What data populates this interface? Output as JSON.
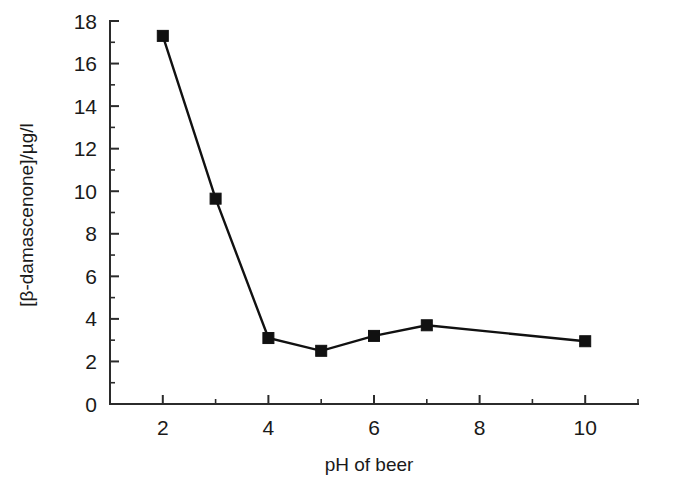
{
  "chart_data": {
    "type": "line",
    "title": "",
    "subtitle": "",
    "xlabel": "pH of beer",
    "ylabel": "[β-damascenone]/µg/l",
    "x": [
      2,
      3,
      4,
      5,
      6,
      7,
      10
    ],
    "values": [
      17.3,
      9.65,
      3.1,
      2.5,
      3.2,
      3.7,
      2.95
    ],
    "series": [
      {
        "name": "[β-damascenone]",
        "x": [
          2,
          3,
          4,
          5,
          6,
          7,
          10
        ],
        "values": [
          17.3,
          9.65,
          3.1,
          2.5,
          3.2,
          3.7,
          2.95
        ]
      }
    ],
    "xlim": [
      1,
      11
    ],
    "ylim": [
      0,
      18
    ],
    "xticks": [
      2,
      4,
      6,
      8,
      10
    ],
    "xtick_labels": [
      "2",
      "4",
      "6",
      "8",
      "10"
    ],
    "x_minor_ticks": [
      1,
      3,
      5,
      7,
      9,
      11
    ],
    "yticks": [
      0,
      2,
      4,
      6,
      8,
      10,
      12,
      14,
      16,
      18
    ],
    "ytick_labels": [
      "0",
      "2",
      "4",
      "6",
      "8",
      "10",
      "12",
      "14",
      "16",
      "18"
    ],
    "y_minor_ticks": [
      1,
      3,
      5,
      7,
      9,
      11,
      13,
      15,
      17
    ],
    "grid": false,
    "legend": false,
    "legend_position": "none",
    "marker": "square",
    "marker_color": "#111111",
    "line_color": "#111111",
    "axis_color": "#2b2b2b",
    "background_color": "#ffffff"
  }
}
